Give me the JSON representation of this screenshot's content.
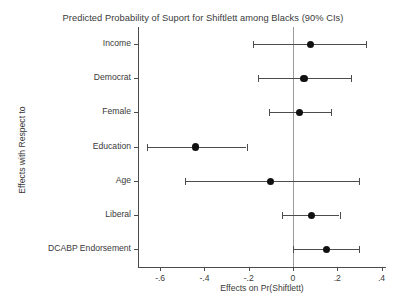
{
  "chart_data": {
    "type": "scatter",
    "title": "Predicted Probability of Suport for Shiftlett among Blacks (90% CIs)",
    "xlabel": "Effects on Pr(Shiftlett)",
    "ylabel": "Effects with Respect to",
    "xlim": [
      -0.7,
      0.42
    ],
    "xticks": [
      -0.6,
      -0.4,
      -0.2,
      0,
      0.2,
      0.4
    ],
    "xtick_labels": [
      "-.6",
      "-.4",
      "-.2",
      "0",
      ".2",
      ".4"
    ],
    "grid": false,
    "legend": "none",
    "reference_line": 0,
    "categories": [
      "Income",
      "Democrat",
      "Female",
      "Education",
      "Age",
      "Liberal",
      "DCABP Endorsement"
    ],
    "estimates": [
      0.08,
      0.05,
      0.03,
      -0.44,
      -0.1,
      0.085,
      0.15
    ],
    "ci_low": [
      -0.18,
      -0.16,
      -0.11,
      -0.66,
      -0.49,
      -0.05,
      0.0
    ],
    "ci_high": [
      0.33,
      0.26,
      0.17,
      -0.21,
      0.3,
      0.21,
      0.3
    ],
    "points": [
      {
        "label": "Income",
        "estimate": 0.08,
        "ci_low": -0.18,
        "ci_high": 0.33
      },
      {
        "label": "Democrat",
        "estimate": 0.05,
        "ci_low": -0.16,
        "ci_high": 0.26
      },
      {
        "label": "Female",
        "estimate": 0.03,
        "ci_low": -0.11,
        "ci_high": 0.17
      },
      {
        "label": "Education",
        "estimate": -0.44,
        "ci_low": -0.66,
        "ci_high": -0.21
      },
      {
        "label": "Age",
        "estimate": -0.1,
        "ci_low": -0.49,
        "ci_high": 0.3
      },
      {
        "label": "Liberal",
        "estimate": 0.085,
        "ci_low": -0.05,
        "ci_high": 0.21
      },
      {
        "label": "DCABP Endorsement",
        "estimate": 0.15,
        "ci_low": 0.0,
        "ci_high": 0.3
      }
    ],
    "colors": {
      "marker": "#111111",
      "line": "#4c4c4c",
      "axis": "#4a4a4a",
      "reference": "#9a9a9a",
      "background": "#ffffff",
      "text": "#3a3a3a"
    }
  }
}
